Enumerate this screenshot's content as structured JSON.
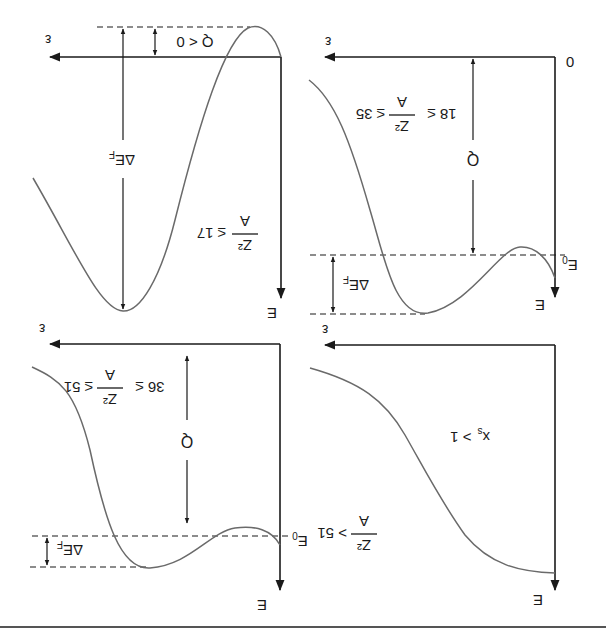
{
  "figure": {
    "orientation": "rotated 180 degrees",
    "panels": [
      {
        "id": "a",
        "condition": {
          "numerator": "Z²",
          "denominator": "A",
          "relation": "≤ 17"
        },
        "axes": {
          "y_label": "E",
          "x_label": "ε"
        },
        "annotations": {
          "barrier_label": "ΔE",
          "barrier_sub": "F",
          "q_label": "Q < 0"
        }
      },
      {
        "id": "b",
        "condition": {
          "prefix": "18 ≤",
          "numerator": "Z²",
          "denominator": "A",
          "relation": "≤ 35"
        },
        "axes": {
          "y_label": "E",
          "x_label": "ε",
          "origin_label": "0"
        },
        "annotations": {
          "e0_label": "E",
          "e0_sub": "0",
          "q_label": "Q",
          "barrier_label": "ΔE",
          "barrier_sub": "F"
        }
      },
      {
        "id": "c",
        "condition": {
          "prefix": "36 ≤",
          "numerator": "Z²",
          "denominator": "A",
          "relation": "≤ 51"
        },
        "axes": {
          "y_label": "E",
          "x_label": "ε"
        },
        "annotations": {
          "e0_label": "E",
          "e0_sub": "0",
          "q_label": "Q",
          "barrier_label": "ΔE",
          "barrier_sub": "F"
        }
      },
      {
        "id": "d",
        "condition": {
          "numerator": "Z²",
          "denominator": "A",
          "relation": "> 51"
        },
        "extra": {
          "label": "x",
          "sub": "s",
          "relation": "> 1"
        },
        "axes": {
          "y_label": "E",
          "x_label": "ε"
        }
      }
    ]
  }
}
